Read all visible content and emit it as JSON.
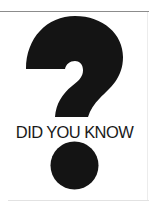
{
  "graphic": {
    "caption": "DID YOU KNOW",
    "symbol": "question-mark",
    "colors": {
      "ink": "#141414",
      "background": "#ffffff",
      "rule": "#8c8c8c"
    }
  }
}
